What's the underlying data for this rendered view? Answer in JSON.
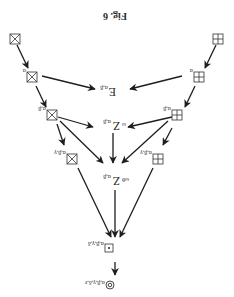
{
  "figure": {
    "title": "Fig. 6",
    "orientation": "rotated 180 degrees",
    "nodes": [
      {
        "id": "n_xbox",
        "symbol": "crossed-box",
        "main": "⊠",
        "sub": ""
      },
      {
        "id": "n_gbox",
        "symbol": "grid-box",
        "main": "⊞",
        "sub": ""
      },
      {
        "id": "n_xbox_a",
        "symbol": "crossed-box",
        "main": "⊠",
        "sub": "α"
      },
      {
        "id": "n_gbox_a",
        "symbol": "grid-box",
        "main": "⊞",
        "sub": "α"
      },
      {
        "id": "n_E",
        "symbol": "E",
        "main": "E",
        "sub": "α,β"
      },
      {
        "id": "n_xbox_ab",
        "symbol": "crossed-box",
        "main": "⊠",
        "sub": "α,β"
      },
      {
        "id": "n_gbox_ab",
        "symbol": "grid-box",
        "main": "⊞",
        "sub": "α,β"
      },
      {
        "id": "n_Zw",
        "symbol": "Z",
        "main": "Z",
        "pre_sub": "ω",
        "sub": "α,β"
      },
      {
        "id": "n_xbox_abg",
        "symbol": "crossed-box",
        "main": "⊠",
        "sub": "α,β,γ"
      },
      {
        "id": "n_gbox_abg",
        "symbol": "grid-box",
        "main": "⊞",
        "sub": "α,β,γ"
      },
      {
        "id": "n_Zwt",
        "symbol": "Z",
        "main": "Z",
        "pre_sub": "ωθ",
        "sub": "α,β"
      },
      {
        "id": "n_dotbox",
        "symbol": "dot-box",
        "main": "⊡",
        "sub": "α,β,γ,δ"
      },
      {
        "id": "n_circ",
        "symbol": "circled-ring",
        "main": "◎",
        "sub": "α,β,γ,δ,ε"
      }
    ],
    "edges": [
      [
        "n_xbox",
        "n_xbox_a"
      ],
      [
        "n_gbox",
        "n_gbox_a"
      ],
      [
        "n_xbox_a",
        "n_E"
      ],
      [
        "n_gbox_a",
        "n_E"
      ],
      [
        "n_xbox_a",
        "n_xbox_ab"
      ],
      [
        "n_gbox_a",
        "n_gbox_ab"
      ],
      [
        "n_xbox_ab",
        "n_Zw"
      ],
      [
        "n_gbox_ab",
        "n_Zw"
      ],
      [
        "n_xbox_ab",
        "n_xbox_abg"
      ],
      [
        "n_gbox_ab",
        "n_gbox_abg"
      ],
      [
        "n_xbox_ab",
        "n_Zwt"
      ],
      [
        "n_gbox_ab",
        "n_Zwt"
      ],
      [
        "n_Zw",
        "n_Zwt"
      ],
      [
        "n_xbox_abg",
        "n_dotbox"
      ],
      [
        "n_gbox_abg",
        "n_dotbox"
      ],
      [
        "n_Zwt",
        "n_dotbox"
      ],
      [
        "n_dotbox",
        "n_circ"
      ]
    ]
  }
}
